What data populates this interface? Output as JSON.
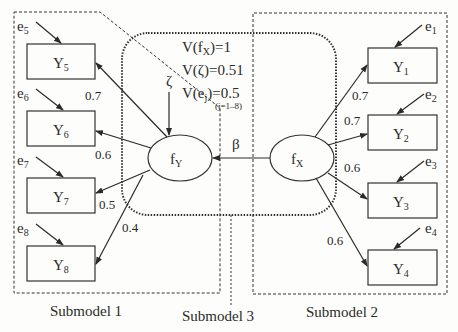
{
  "diagram": {
    "type": "structural-equation-model",
    "submodels": [
      {
        "id": "submodel-1",
        "label": "Submodel 1"
      },
      {
        "id": "submodel-2",
        "label": "Submodel 2"
      },
      {
        "id": "submodel-3",
        "label": "Submodel 3"
      }
    ],
    "latent": {
      "fY": {
        "main": "f",
        "sub": "Y"
      },
      "fX": {
        "main": "f",
        "sub": "X"
      }
    },
    "zeta": "ζ",
    "beta": "β",
    "variances": {
      "line1": {
        "pre": "V(f",
        "sub": "X",
        "post": ")=1"
      },
      "line2": "V(ζ)=0.51",
      "line3": {
        "pre": "V(e",
        "sub": "j",
        "post": ")=0.5"
      },
      "line3_note": "(j=1–8)"
    },
    "indicators_left": [
      {
        "name": "Y",
        "sub": "5",
        "error": "e",
        "error_sub": "5",
        "loading": "0.7"
      },
      {
        "name": "Y",
        "sub": "6",
        "error": "e",
        "error_sub": "6",
        "loading": "0.6"
      },
      {
        "name": "Y",
        "sub": "7",
        "error": "e",
        "error_sub": "7",
        "loading": "0.5"
      },
      {
        "name": "Y",
        "sub": "8",
        "error": "e",
        "error_sub": "8",
        "loading": "0.4"
      }
    ],
    "indicators_right": [
      {
        "name": "Y",
        "sub": "1",
        "error": "e",
        "error_sub": "1",
        "loading": "0.7"
      },
      {
        "name": "Y",
        "sub": "2",
        "error": "e",
        "error_sub": "2",
        "loading": "0.7"
      },
      {
        "name": "Y",
        "sub": "3",
        "error": "e",
        "error_sub": "3",
        "loading": "0.6"
      },
      {
        "name": "Y",
        "sub": "4",
        "error": "e",
        "error_sub": "4",
        "loading": "0.6"
      }
    ]
  }
}
